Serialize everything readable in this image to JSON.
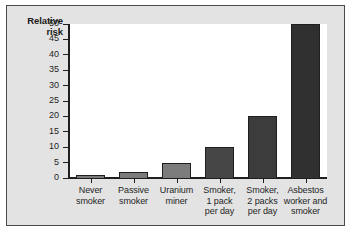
{
  "figure": {
    "background_color": "#e3e3e3",
    "plot_background_color": "#ffffff",
    "border_color": "#4a4a4a"
  },
  "chart_data": {
    "type": "bar",
    "title": "",
    "xlabel": "",
    "ylabel": "Relative risk",
    "ylabel_line1": "Relative",
    "ylabel_line2": "risk",
    "categories": [
      "Never smoker",
      "Passive smoker",
      "Uranium miner",
      "Smoker, 1 pack per day",
      "Smoker, 2 packs per day",
      "Asbestos worker and smoker"
    ],
    "category_lines": [
      [
        "Never",
        "smoker"
      ],
      [
        "Passive",
        "smoker"
      ],
      [
        "Uranium",
        "miner"
      ],
      [
        "Smoker,",
        "1 pack",
        "per day"
      ],
      [
        "Smoker,",
        "2 packs",
        "per day"
      ],
      [
        "Asbestos",
        "worker and",
        "smoker"
      ]
    ],
    "values": [
      1,
      2,
      5,
      10,
      20,
      50
    ],
    "bar_colors": [
      "#7c7c7c",
      "#7c7c7c",
      "#7c7c7c",
      "#464646",
      "#3c3c3c",
      "#303030"
    ],
    "ylim": [
      0,
      50
    ],
    "ytick_values": [
      0,
      5,
      10,
      15,
      20,
      25,
      30,
      35,
      40,
      45,
      50
    ],
    "ytick_labels": [
      "0",
      "5",
      "10",
      "15",
      "20",
      "25",
      "30",
      "35",
      "40",
      "45",
      "50"
    ],
    "grid": false,
    "legend": "none"
  }
}
